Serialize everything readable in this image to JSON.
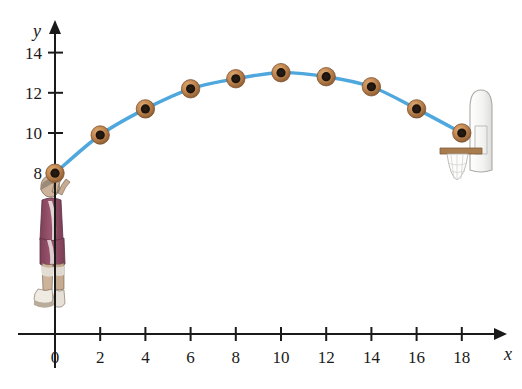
{
  "figure": {
    "background_color": "#ffffff",
    "axis_color": "#1a1a1a",
    "curve_color": "#4ea7dd",
    "ball_color": "#c08a52",
    "ball_core_color": "#241a12"
  },
  "axes": {
    "x_axis_label": "x",
    "y_axis_label": "y",
    "x_ticks": [
      "0",
      "2",
      "4",
      "6",
      "8",
      "10",
      "12",
      "14",
      "16",
      "18"
    ],
    "y_ticks": [
      "8",
      "10",
      "12",
      "14"
    ]
  },
  "illustrations": {
    "player": {
      "name": "basketball-player",
      "jersey_color": "#8c4a63",
      "skin_color": "#d9b48f",
      "shoe_color": "#ded7cd"
    },
    "hoop": {
      "name": "basketball-hoop",
      "backboard_color": "#f4f4f2",
      "rim_color": "#a97c50",
      "net_color": "#fbfbfb"
    }
  },
  "chart_data": {
    "type": "scatter",
    "title": "",
    "xlabel": "x",
    "ylabel": "y",
    "xlim": [
      0,
      19
    ],
    "ylim": [
      0,
      15
    ],
    "grid": false,
    "legend": false,
    "x_ticks": [
      0,
      2,
      4,
      6,
      8,
      10,
      12,
      14,
      16,
      18
    ],
    "y_ticks": [
      8,
      10,
      12,
      14
    ],
    "point_marker": "basketball",
    "series": [
      {
        "name": "Basketball trajectory",
        "x": [
          0,
          2,
          4,
          6,
          8,
          10,
          12,
          14,
          16,
          18
        ],
        "y": [
          8.0,
          9.9,
          11.2,
          12.2,
          12.7,
          13.0,
          12.8,
          12.3,
          11.2,
          10.0
        ]
      }
    ],
    "curve": {
      "name": "trajectory-curve",
      "description": "smooth parabolic arc through the basketball positions",
      "color": "#4ea7dd",
      "width": 3
    },
    "annotations": [
      {
        "name": "player-figure",
        "x": 0,
        "y": 8,
        "label": ""
      },
      {
        "name": "hoop-figure",
        "x": 18,
        "y": 10,
        "label": ""
      }
    ]
  }
}
